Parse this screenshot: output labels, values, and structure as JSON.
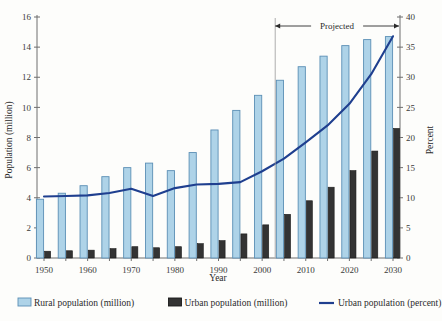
{
  "chart_data": {
    "type": "bar",
    "title": "",
    "xlabel": "Year",
    "ylabel": "Population (million)",
    "y2label": "Percent",
    "ylim": [
      0,
      16
    ],
    "y2lim": [
      0,
      40
    ],
    "ytick_step": 2,
    "y2tick_step": 5,
    "grid": false,
    "legend_position": "bottom",
    "categories": [
      1950,
      1955,
      1960,
      1965,
      1970,
      1975,
      1980,
      1985,
      1990,
      1995,
      2000,
      2005,
      2010,
      2015,
      2020,
      2025,
      2030
    ],
    "xtick_labels": [
      "1950",
      "1960",
      "1970",
      "1980",
      "1990",
      "2000",
      "2010",
      "2020",
      "2030"
    ],
    "xtick_values": [
      1950,
      1960,
      1970,
      1980,
      1990,
      2000,
      2010,
      2020,
      2030
    ],
    "series": [
      {
        "name": "Rural population (million)",
        "type": "bar",
        "axis": "left",
        "color": "#aed3e8",
        "edge_color": "#5b8fb5",
        "values": [
          3.9,
          4.3,
          4.8,
          5.4,
          6.0,
          6.3,
          5.8,
          7.0,
          8.5,
          9.8,
          10.8,
          11.8,
          12.7,
          13.4,
          14.1,
          14.5,
          14.7
        ]
      },
      {
        "name": "Urban population (million)",
        "type": "bar",
        "axis": "left",
        "color": "#333333",
        "edge_color": "#1a1a1a",
        "values": [
          0.45,
          0.48,
          0.52,
          0.62,
          0.75,
          0.68,
          0.75,
          0.95,
          1.15,
          1.6,
          2.2,
          2.9,
          3.8,
          4.7,
          5.8,
          7.1,
          8.6
        ]
      },
      {
        "name": "Urban population (percent)",
        "type": "line",
        "axis": "right",
        "color": "#1f3f8f",
        "values": [
          10.2,
          10.3,
          10.4,
          10.8,
          11.5,
          10.3,
          11.6,
          12.2,
          12.3,
          12.6,
          14.4,
          16.5,
          19.2,
          22.0,
          25.6,
          30.5,
          36.8
        ]
      }
    ],
    "annotations": [
      {
        "name": "projected-span",
        "label": "Projected",
        "start_year": 2003,
        "end_year": 2030,
        "style": "double-headed-arrow"
      }
    ]
  },
  "legend": {
    "items": [
      {
        "label": "Rural population (million)",
        "swatch": "bar-light-blue"
      },
      {
        "label": "Urban population (million)",
        "swatch": "bar-dark"
      },
      {
        "label": "Urban population (percent)",
        "swatch": "line-navy"
      }
    ]
  },
  "axes": {
    "left_ticks": [
      "0",
      "2",
      "4",
      "6",
      "8",
      "10",
      "12",
      "14",
      "16"
    ],
    "right_ticks": [
      "0",
      "5",
      "10",
      "15",
      "20",
      "25",
      "30",
      "35",
      "40"
    ]
  },
  "colors": {
    "rural_fill": "#aed3e8",
    "rural_edge": "#5b8fb5",
    "urban_fill": "#333333",
    "line": "#1f3f8f",
    "axis": "#6f6f6f",
    "text": "#2b2b2b",
    "background": "#fdfdfb"
  }
}
